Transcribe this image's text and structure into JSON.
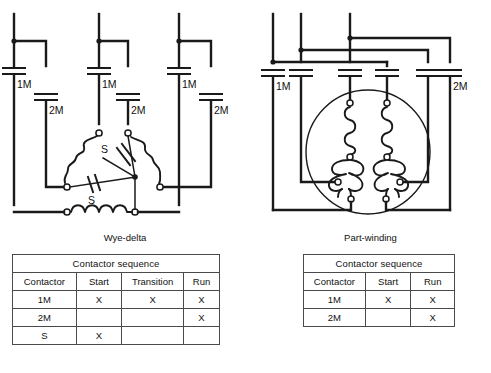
{
  "figure": {
    "diagrams": [
      {
        "id": "wye-delta",
        "caption": "Wye-delta",
        "labels": {
          "contactor_1m_a": "1M",
          "contactor_1m_b": "1M",
          "contactor_1m_c": "1M",
          "contactor_2m_a": "2M",
          "contactor_2m_b": "2M",
          "contactor_2m_c": "2M",
          "contactor_s_upper": "S",
          "contactor_s_lower": "S"
        }
      },
      {
        "id": "part-winding",
        "caption": "Part-winding",
        "labels": {
          "contactor_1m": "1M",
          "contactor_2m": "2M"
        }
      }
    ]
  },
  "tables": {
    "wye_delta": {
      "title": "Contactor sequence",
      "headers": [
        "Contactor",
        "Start",
        "Transition",
        "Run"
      ],
      "rows": [
        {
          "contactor": "1M",
          "start": "X",
          "transition": "X",
          "run": "X"
        },
        {
          "contactor": "2M",
          "start": "",
          "transition": "",
          "run": "X"
        },
        {
          "contactor": "S",
          "start": "X",
          "transition": "",
          "run": ""
        }
      ]
    },
    "part_winding": {
      "title": "Contactor sequence",
      "headers": [
        "Contactor",
        "Start",
        "Run"
      ],
      "rows": [
        {
          "contactor": "1M",
          "start": "X",
          "run": "X"
        },
        {
          "contactor": "2M",
          "start": "",
          "run": "X"
        }
      ]
    }
  },
  "colors": {
    "wire": "#1a1a1a",
    "background": "#ffffff",
    "table_border": "#4a4a4a",
    "text": "#111111"
  }
}
